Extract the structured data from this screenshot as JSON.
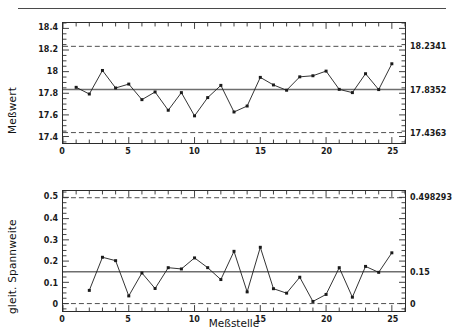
{
  "figure": {
    "xlabel": "Meßstelle",
    "background": "#ffffff",
    "line_color": "#1a1a1a",
    "center_line_color": "#6e6e6e",
    "limit_line_color": "#3a3a3a",
    "top_rule_color": "#4a4a4a"
  },
  "chart_data": [
    {
      "type": "line",
      "name": "individuals-chart",
      "title": "",
      "ylabel": "Meßwert",
      "xlabel": "Meßstelle",
      "x": [
        1,
        2,
        3,
        4,
        5,
        6,
        7,
        8,
        9,
        10,
        11,
        12,
        13,
        14,
        15,
        16,
        17,
        18,
        19,
        20,
        21,
        22,
        23,
        24,
        25
      ],
      "values": [
        17.855,
        17.793,
        18.011,
        17.849,
        17.885,
        17.741,
        17.812,
        17.643,
        17.806,
        17.591,
        17.76,
        17.873,
        17.627,
        17.682,
        17.947,
        17.877,
        17.828,
        17.952,
        17.962,
        18.005,
        17.836,
        17.806,
        17.981,
        17.834,
        18.073
      ],
      "ylim": [
        17.34,
        18.45
      ],
      "yticks": [
        17.4,
        17.6,
        17.8,
        18,
        18.2,
        18.4
      ],
      "yticklabels": [
        "17.4",
        "17.6",
        "17.8",
        "18",
        "18.2",
        "18.4"
      ],
      "xlim": [
        0,
        26
      ],
      "xticks": [
        0,
        5,
        10,
        15,
        20,
        25
      ],
      "xticklabels": [
        "0",
        "5",
        "10",
        "15",
        "20",
        "25"
      ],
      "center_line": 17.8352,
      "upper_limit": 18.2341,
      "lower_limit": 17.4363,
      "right_labels": [
        "18.2341",
        "17.8352",
        "17.4363"
      ],
      "right_values": [
        18.2341,
        17.8352,
        17.4363
      ],
      "grid": false,
      "legend": "none",
      "marker": "square"
    },
    {
      "type": "line",
      "name": "moving-range-chart",
      "title": "",
      "ylabel": "gleit. Spannweite",
      "xlabel": "Meßstelle",
      "x": [
        2,
        3,
        4,
        5,
        6,
        7,
        8,
        9,
        10,
        11,
        12,
        13,
        14,
        15,
        16,
        17,
        18,
        19,
        20,
        21,
        22,
        23,
        24,
        25
      ],
      "values": [
        0.062,
        0.218,
        0.202,
        0.036,
        0.144,
        0.071,
        0.169,
        0.163,
        0.215,
        0.169,
        0.113,
        0.246,
        0.055,
        0.265,
        0.07,
        0.049,
        0.124,
        0.01,
        0.043,
        0.169,
        0.03,
        0.175,
        0.147,
        0.239
      ],
      "ylim": [
        -0.035,
        0.53
      ],
      "yticks": [
        0,
        0.1,
        0.2,
        0.3,
        0.4,
        0.5
      ],
      "yticklabels": [
        "0",
        "0.1",
        "0.2",
        "0.3",
        "0.4",
        "0.5"
      ],
      "xlim": [
        0,
        26
      ],
      "xticks": [
        0,
        5,
        10,
        15,
        20,
        25
      ],
      "xticklabels": [
        "0",
        "5",
        "10",
        "15",
        "20",
        "25"
      ],
      "center_line": 0.15,
      "upper_limit": 0.498293,
      "lower_limit": 0,
      "right_labels": [
        "0.498293",
        "0.15",
        "0"
      ],
      "right_values": [
        0.498293,
        0.15,
        0
      ],
      "grid": false,
      "legend": "none",
      "marker": "square"
    }
  ]
}
